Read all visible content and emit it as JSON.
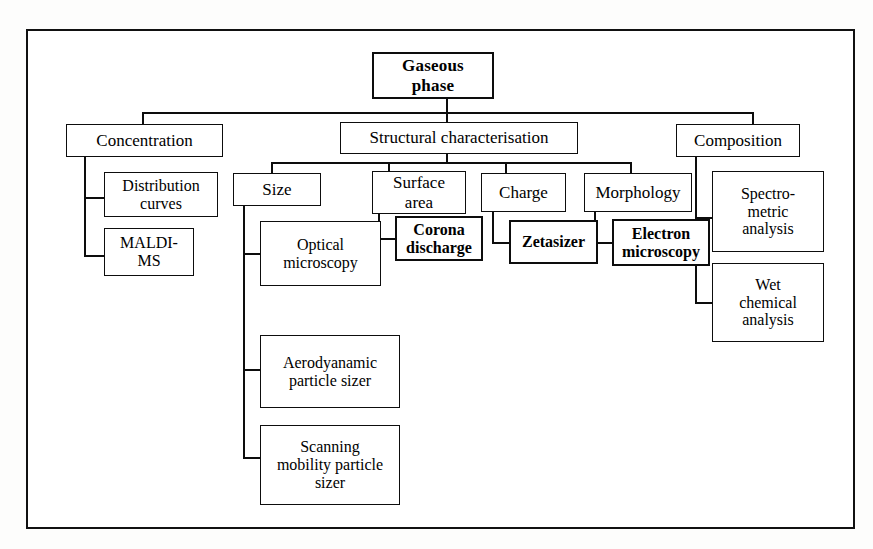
{
  "diagram": {
    "type": "tree-hierarchy",
    "frame": {
      "style": "double-ruled rectangle",
      "color": "#111111"
    },
    "root": {
      "id": "root",
      "label": "Gaseous\nphase",
      "bold": true
    },
    "level1": [
      {
        "id": "concentration",
        "label": "Concentration"
      },
      {
        "id": "structural",
        "label": "Structural characterisation"
      },
      {
        "id": "composition",
        "label": "Composition"
      }
    ],
    "level2": [
      {
        "id": "size",
        "label": "Size",
        "parent": "structural"
      },
      {
        "id": "surface-area",
        "label": "Surface\narea",
        "parent": "structural"
      },
      {
        "id": "charge",
        "label": "Charge",
        "parent": "structural"
      },
      {
        "id": "morphology",
        "label": "Morphology",
        "parent": "structural"
      }
    ],
    "leaves": {
      "concentration": [
        {
          "id": "distribution-curves",
          "label": "Distribution\ncurves"
        },
        {
          "id": "maldi-ms",
          "label": "MALDI-\nMS"
        }
      ],
      "size": [
        {
          "id": "optical-microscopy",
          "label": "Optical\nmicroscopy"
        },
        {
          "id": "aerodyanamic-particle-sizer",
          "label": "Aerodyanamic\nparticle sizer"
        },
        {
          "id": "scanning-mobility-particle-sizer",
          "label": "Scanning\nmobility particle\nsizer"
        }
      ],
      "surface-area": [
        {
          "id": "corona-discharge",
          "label": "Corona\ndischarge"
        }
      ],
      "charge": [
        {
          "id": "zetasizer",
          "label": "Zetasizer"
        }
      ],
      "morphology": [
        {
          "id": "electron-microscopy",
          "label": "Electron\nmicroscopy"
        }
      ],
      "composition": [
        {
          "id": "spectrometric-analysis",
          "label": "Spectro-\nmetric\nanalysis"
        },
        {
          "id": "wet-chemical-analysis",
          "label": "Wet\nchemical\nanalysis"
        }
      ]
    }
  }
}
